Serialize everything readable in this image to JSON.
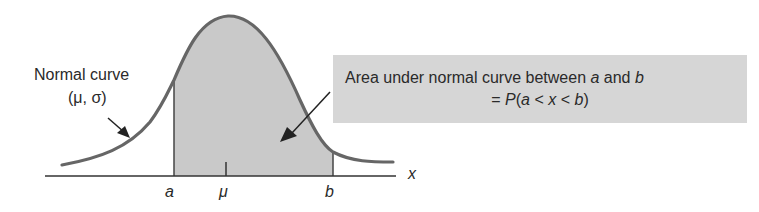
{
  "diagram": {
    "title": "Area under normal curve between a and b",
    "curve_label": {
      "line1": "Normal curve",
      "line2": "(μ, σ)"
    },
    "callout": {
      "line1_prefix": "Area under normal curve between ",
      "var_a": "a",
      "and": " and ",
      "var_b": "b",
      "line2_eq": "= ",
      "line2_P": "P",
      "line2_open": "(",
      "line2_a": "a",
      "line2_lt1": " < ",
      "line2_x": "x",
      "line2_lt2": " < ",
      "line2_b": "b",
      "line2_close": ")"
    },
    "axis": {
      "x_label": "x",
      "tick_a": "a",
      "tick_mu": "μ",
      "tick_b": "b"
    },
    "colors": {
      "curve": "#666666",
      "shaded_area": "#c9c9c9",
      "callout_bg": "#d6d6d6",
      "axis": "#333333",
      "text": "#2a2a2a"
    }
  }
}
